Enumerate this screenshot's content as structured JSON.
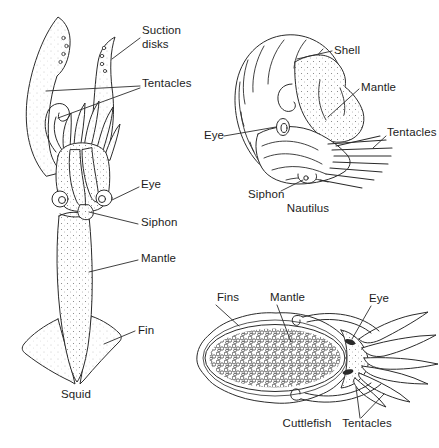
{
  "colors": {
    "background": "#ffffff",
    "ink": "#2b2b2b",
    "text": "#1c1c1c"
  },
  "panels": {
    "squid": {
      "caption": "Squid",
      "labels": {
        "suction_disks": "Suction disks",
        "tentacles": "Tentacles",
        "eye": "Eye",
        "siphon": "Siphon",
        "mantle": "Mantle",
        "fin": "Fin"
      }
    },
    "nautilus": {
      "caption": "Nautilus",
      "labels": {
        "shell": "Shell",
        "mantle": "Mantle",
        "tentacles": "Tentacles",
        "eye": "Eye",
        "siphon": "Siphon"
      }
    },
    "cuttlefish": {
      "caption": "Cuttlefish",
      "labels": {
        "fins": "Fins",
        "mantle": "Mantle",
        "eye": "Eye",
        "tentacles": "Tentacles"
      }
    }
  }
}
